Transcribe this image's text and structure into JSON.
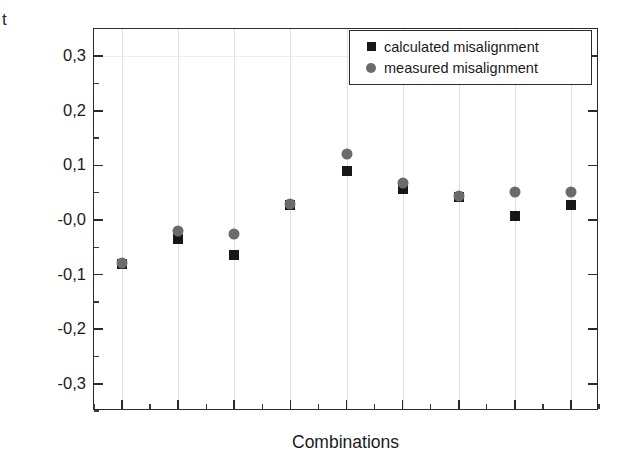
{
  "chart_data": {
    "type": "scatter",
    "title": "",
    "xlabel": "Combinations",
    "ylabel": "Misalignment to center of the crystal [mm]",
    "ylim": [
      -0.35,
      0.35
    ],
    "yticks": [
      "0,3",
      "0,2",
      "0,1",
      "-0,0",
      "-0,1",
      "-0,2",
      "-0,3"
    ],
    "ytick_values": [
      0.3,
      0.2,
      0.1,
      0.0,
      -0.1,
      -0.2,
      -0.3
    ],
    "xticks": [],
    "grid": "vertical-faint",
    "legend_position": "top-right",
    "x": [
      1,
      2,
      3,
      4,
      5,
      6,
      7,
      8,
      9
    ],
    "series": [
      {
        "name": "calculated misalignment",
        "marker": "square",
        "color": "#171717",
        "values": [
          -0.081,
          -0.034,
          -0.064,
          0.028,
          0.089,
          0.057,
          0.042,
          0.008,
          0.028
        ]
      },
      {
        "name": "measured misalignment",
        "marker": "circle",
        "color": "#6b6b6b",
        "values": [
          -0.079,
          -0.021,
          -0.026,
          0.03,
          0.121,
          0.068,
          0.044,
          0.051,
          0.051
        ]
      }
    ]
  },
  "axes": {
    "ylabel": "Misalignment to center of the crystal [mm]",
    "xlabel": "Combinations",
    "ytick_labels": [
      "0,3",
      "0,2",
      "0,1",
      "-0,0",
      "-0,1",
      "-0,2",
      "-0,3"
    ],
    "stray_glyph": "t"
  },
  "legend": {
    "items": [
      {
        "label": "calculated misalignment",
        "marker": "square-marker-icon"
      },
      {
        "label": "measured misalignment",
        "marker": "circle-marker-icon"
      }
    ]
  },
  "colors": {
    "calculated": "#171717",
    "measured": "#6b6b6b",
    "axis": "#2b2b2b",
    "grid": "#e2e2e6",
    "background": "#ffffff"
  }
}
